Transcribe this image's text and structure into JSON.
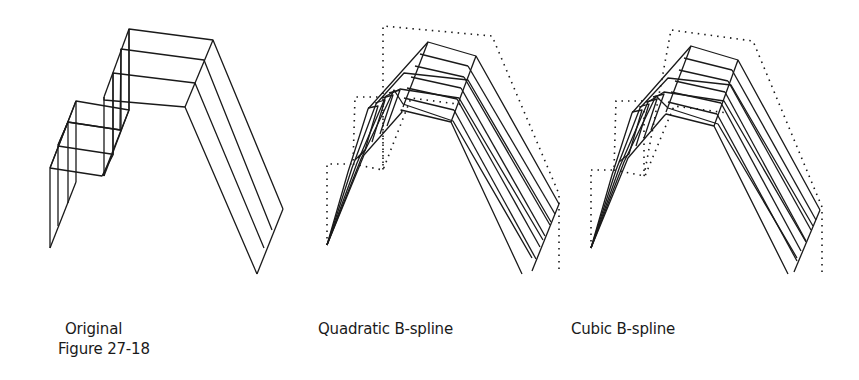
{
  "figure": {
    "caption": "Figure 27-18",
    "panels": [
      {
        "id": "original",
        "label": "Original"
      },
      {
        "id": "quadratic",
        "label": "Quadratic B-spline"
      },
      {
        "id": "cubic",
        "label": "Cubic B-spline"
      }
    ]
  },
  "colors": {
    "ink": "#1a1a1a",
    "background": "#ffffff"
  }
}
